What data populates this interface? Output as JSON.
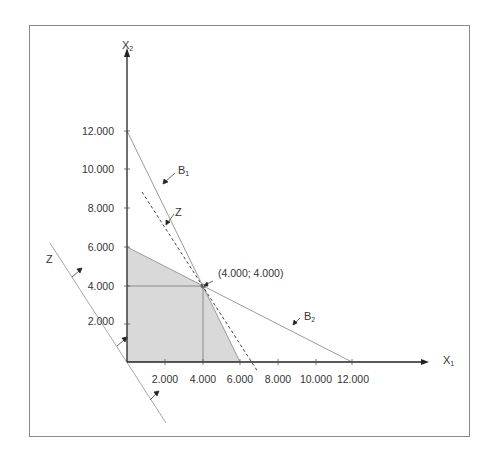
{
  "diagram": {
    "type": "linear-programming-graph",
    "axes": {
      "x": {
        "name": "X",
        "subscript": "1"
      },
      "y": {
        "name": "X",
        "subscript": "2"
      }
    },
    "x_ticks": [
      "2.000",
      "4.000",
      "6.000",
      "8.000",
      "10.000",
      "12.000"
    ],
    "y_ticks": [
      "2.000",
      "4.000",
      "6.000",
      "8.000",
      "10.000",
      "12.000"
    ],
    "lines": {
      "b1": {
        "name": "B",
        "subscript": "1",
        "from": [
          0,
          12000
        ],
        "to": [
          6000,
          0
        ]
      },
      "b2": {
        "name": "B",
        "subscript": "2",
        "from": [
          0,
          6000
        ],
        "to": [
          12000,
          0
        ]
      },
      "z_origin": {
        "name": "Z",
        "style": "solid",
        "through": [
          0,
          0
        ]
      },
      "z_optimal": {
        "name": "Z",
        "style": "dashed",
        "through": [
          4000,
          4000
        ]
      }
    },
    "feasible_region": [
      [
        0,
        0
      ],
      [
        0,
        6000
      ],
      [
        4000,
        4000
      ],
      [
        6000,
        0
      ]
    ],
    "optimum": {
      "label": "(4.000; 4.000)",
      "x": 4000,
      "y": 4000
    },
    "colors": {
      "feasible_fill": "#d9d9d9",
      "axis": "#222222",
      "constraint_line": "#9a9a9a",
      "frame": "#8a8a8a"
    }
  }
}
